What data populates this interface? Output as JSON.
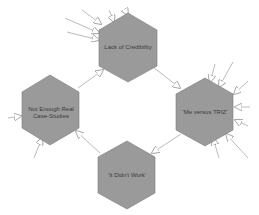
{
  "diagram": {
    "type": "cycle",
    "colors": {
      "node_fill": "#9a9a9a",
      "node_stroke": "#7a7a7a",
      "edge": "#aaaaaa",
      "arrowhead_fill": "#ffffff",
      "arrowhead_stroke": "#999999"
    },
    "nodes": [
      {
        "id": "top",
        "label": "Lack of Credibility"
      },
      {
        "id": "right",
        "label": "'Me versus TRIZ'"
      },
      {
        "id": "bottom",
        "label": "'It Didn't Work'"
      },
      {
        "id": "left",
        "label": "Not Enough Real Case-Studies"
      }
    ],
    "edges": [
      {
        "from": "top",
        "to": "right"
      },
      {
        "from": "right",
        "to": "bottom"
      },
      {
        "from": "bottom",
        "to": "left"
      },
      {
        "from": "left",
        "to": "top"
      }
    ],
    "external_inputs": {
      "top": 5,
      "right": 7,
      "left": 2,
      "bottom": 0
    }
  }
}
